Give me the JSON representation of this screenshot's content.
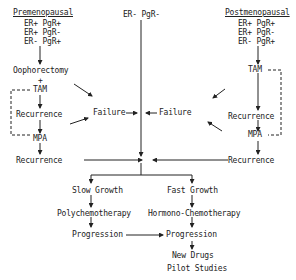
{
  "diagram": {
    "left": {
      "heading": "Premenopausal",
      "receptors": [
        "ER+ PgR+",
        "ER+ PgR-",
        "ER- PgR+"
      ],
      "step1": "Oophorectomy",
      "plus": "+",
      "step2": "TAM",
      "recurrence1": "Recurrence",
      "step3": "MPA",
      "recurrence2": "Recurrence"
    },
    "right": {
      "heading": "Postmenopausal",
      "receptors": [
        "ER+ PgR+",
        "ER+ PgR-",
        "ER- PgR+"
      ],
      "step1": "TAM",
      "recurrence1": "Recurrence",
      "step2": "MPA",
      "recurrence2": "Recurrence"
    },
    "center": {
      "top": "ER- PgR-",
      "failure_left": "Failure",
      "failure_right": "Failure"
    },
    "bottom": {
      "slow_growth": "Slow Growth",
      "fast_growth": "Fast Growth",
      "polychemotherapy": "Polychemotherapy",
      "hormono_chemotherapy": "Hormono-Chemotherapy",
      "progression_left": "Progression",
      "progression_right": "Progression",
      "new_drugs": "New Drugs",
      "pilot_studies": "Pilot Studies"
    }
  }
}
